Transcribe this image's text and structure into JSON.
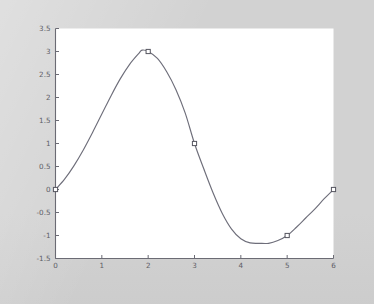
{
  "figure": {
    "background_color": "#d2d2d2",
    "plot_background_color": "#ffffff",
    "line_color": "#6e6e7a",
    "axis_color": "#6b6b74",
    "marker_face_color": "#ffffff",
    "marker_edge_color": "#55555f"
  },
  "chart_data": {
    "type": "line",
    "title": "",
    "subtitle": "",
    "xlabel": "",
    "ylabel": "",
    "xlim": [
      0,
      6
    ],
    "ylim": [
      -1.5,
      3.5
    ],
    "grid": false,
    "legend": null,
    "legend_position": "none",
    "x_ticks": [
      0,
      1,
      2,
      3,
      4,
      5,
      6
    ],
    "x_tick_labels": [
      "0",
      "1",
      "2",
      "3",
      "4",
      "5",
      "6"
    ],
    "y_ticks": [
      -1.5,
      -1,
      -0.5,
      0,
      0.5,
      1,
      1.5,
      2,
      2.5,
      3,
      3.5
    ],
    "y_tick_labels": [
      "-1.5",
      "-1",
      "-0.5",
      "0",
      "0.5",
      "1",
      "1.5",
      "2",
      "2.5",
      "3",
      "3.5"
    ],
    "series": [
      {
        "name": "curve",
        "line_style": "solid",
        "marker": "open-square",
        "x": [
          0,
          0.2,
          0.4,
          0.6,
          0.8,
          1,
          1.2,
          1.4,
          1.6,
          1.8,
          1.87,
          2,
          2.2,
          2.4,
          2.6,
          2.8,
          3,
          3.2,
          3.4,
          3.6,
          3.8,
          4,
          4.2,
          4.4,
          4.6,
          4.8,
          5,
          5.2,
          5.4,
          5.6,
          5.8,
          6
        ],
        "y": [
          0,
          0.23,
          0.52,
          0.86,
          1.24,
          1.64,
          2.04,
          2.41,
          2.72,
          2.96,
          3.03,
          3.0,
          2.85,
          2.56,
          2.17,
          1.66,
          1.0,
          0.45,
          -0.07,
          -0.52,
          -0.86,
          -1.07,
          -1.16,
          -1.17,
          -1.17,
          -1.11,
          -1.0,
          -0.82,
          -0.62,
          -0.42,
          -0.2,
          0
        ],
        "markers": [
          {
            "x": 0,
            "y": 0,
            "label": "0, 0"
          },
          {
            "x": 2,
            "y": 3,
            "label": "2, 3"
          },
          {
            "x": 3,
            "y": 1,
            "label": "3, 1"
          },
          {
            "x": 5,
            "y": -1,
            "label": "5, -1"
          },
          {
            "x": 6,
            "y": 0,
            "label": "6, 0"
          }
        ]
      }
    ],
    "annotations": []
  }
}
